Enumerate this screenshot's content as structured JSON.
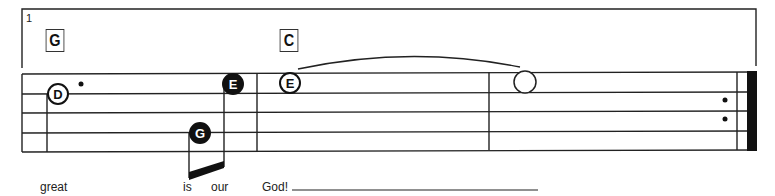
{
  "ending": {
    "number": "1"
  },
  "chords": [
    {
      "label": "G"
    },
    {
      "label": "C"
    }
  ],
  "notes": [
    {
      "label": "D",
      "style": "open",
      "duration": "dotted-quarter"
    },
    {
      "label": "G",
      "style": "filled",
      "duration": "sixteenth"
    },
    {
      "label": "E",
      "style": "filled",
      "duration": "eighth"
    },
    {
      "label": "E",
      "style": "open",
      "duration": "whole-tied"
    },
    {
      "label": "",
      "style": "hollow",
      "duration": "whole"
    }
  ],
  "lyrics": [
    {
      "text": "great"
    },
    {
      "text": "is"
    },
    {
      "text": "our"
    },
    {
      "text": "God!"
    }
  ],
  "staff": {
    "lines": 5,
    "end_barline": "repeat"
  },
  "colors": {
    "ink": "#111111",
    "paper": "#ffffff"
  }
}
